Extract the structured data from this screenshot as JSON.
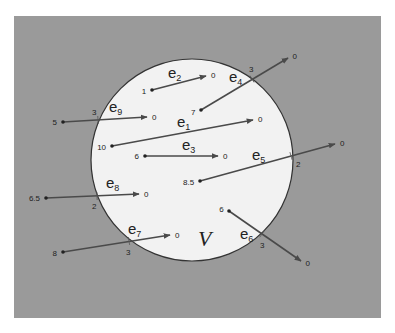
{
  "figure": {
    "background": "#ffffff",
    "region": {
      "x": 14,
      "y": 16,
      "width": 367,
      "height": 302,
      "fill": "#9a9a9a",
      "label": "outside-region"
    },
    "set": {
      "cx": 192,
      "cy": 160,
      "r": 101,
      "fill": "#f2f2f2",
      "stroke": "#333333",
      "label": "V",
      "label_x": 198,
      "label_y": 246
    },
    "arrow_color": "#4a4a4a",
    "edges": [
      {
        "name": "e2",
        "sub": "2",
        "x1": 152,
        "y1": 90,
        "x2": 206,
        "y2": 76,
        "start_label": "1",
        "end_label": "0",
        "label_x": 168,
        "label_y": 78,
        "cross": null
      },
      {
        "name": "e4",
        "sub": "4",
        "x1": 201,
        "y1": 110,
        "x2": 288,
        "y2": 58,
        "start_label": "7",
        "end_label": "0",
        "label_x": 229,
        "label_y": 82,
        "cross": {
          "x": 252,
          "y": 79,
          "value": "3",
          "vx": 249,
          "vy": 72
        }
      },
      {
        "name": "e9",
        "sub": "9",
        "x1": 63,
        "y1": 122,
        "x2": 147,
        "y2": 117,
        "start_label": "5",
        "end_label": "0",
        "label_x": 109,
        "label_y": 112,
        "cross": {
          "x": 98,
          "y": 120,
          "value": "3",
          "vx": 92,
          "vy": 115
        }
      },
      {
        "name": "e1",
        "sub": "1",
        "x1": 112,
        "y1": 146,
        "x2": 253,
        "y2": 120,
        "start_label": "10",
        "end_label": "0",
        "label_x": 177,
        "label_y": 127,
        "cross": null
      },
      {
        "name": "e3",
        "sub": "3",
        "x1": 145,
        "y1": 156,
        "x2": 218,
        "y2": 156,
        "start_label": "6",
        "end_label": "0",
        "label_x": 182,
        "label_y": 150,
        "cross": null
      },
      {
        "name": "e5",
        "sub": "5",
        "x1": 200,
        "y1": 181,
        "x2": 335,
        "y2": 144,
        "start_label": "8.5",
        "end_label": "0",
        "label_x": 252,
        "label_y": 160,
        "cross": {
          "x": 291,
          "y": 156,
          "value": "2",
          "vx": 296,
          "vy": 167
        }
      },
      {
        "name": "e8",
        "sub": "8",
        "x1": 46,
        "y1": 198,
        "x2": 139,
        "y2": 194,
        "start_label": "6.5",
        "end_label": "0",
        "label_x": 106,
        "label_y": 188,
        "cross": {
          "x": 97,
          "y": 196,
          "value": "2",
          "vx": 92,
          "vy": 209
        }
      },
      {
        "name": "e7",
        "sub": "7",
        "x1": 63,
        "y1": 252,
        "x2": 170,
        "y2": 235,
        "start_label": "8",
        "end_label": "0",
        "label_x": 128,
        "label_y": 234,
        "cross": {
          "x": 129,
          "y": 241,
          "value": "3",
          "vx": 126,
          "vy": 255
        }
      },
      {
        "name": "e6",
        "sub": "6",
        "x1": 229,
        "y1": 211,
        "x2": 301,
        "y2": 261,
        "start_label": "6",
        "end_label": "0",
        "label_x": 240,
        "label_y": 239,
        "cross": {
          "x": 262,
          "y": 234,
          "value": "3",
          "vx": 260,
          "vy": 248
        }
      }
    ]
  }
}
